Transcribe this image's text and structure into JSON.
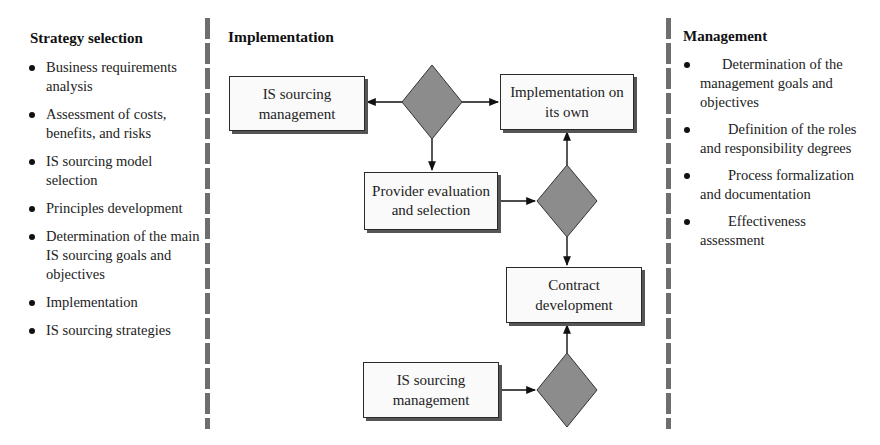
{
  "strategy": {
    "title": "Strategy selection",
    "items": [
      {
        "label": "Business requirements analysis"
      },
      {
        "label": "Assessment of costs, benefits, and risks"
      },
      {
        "label": "IS sourcing model selection"
      },
      {
        "label": "Principles development"
      },
      {
        "label": "Determination of the main IS sourcing goals and objectives"
      },
      {
        "label": "Implementation"
      },
      {
        "label": "IS sourcing strategies"
      }
    ]
  },
  "implementation": {
    "title": "Implementation",
    "boxes": {
      "is_sourcing_top": "IS sourcing management",
      "implementation_own": "Implementation on its own",
      "provider_eval": "Provider evaluation and selection",
      "contract_dev": "Contract development",
      "is_sourcing_bottom": "IS sourcing management"
    },
    "decision_color": "#8c8c8c"
  },
  "management": {
    "title": "Management",
    "items": [
      {
        "label": "Determination of the management goals and objectives"
      },
      {
        "label": "Definition of the roles and responsibility degrees"
      },
      {
        "label": "Process formalization and documentation"
      },
      {
        "label": "Effectiveness assessment"
      }
    ]
  }
}
